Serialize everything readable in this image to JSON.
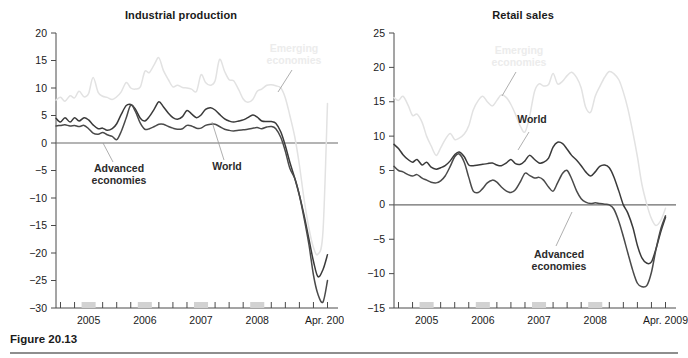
{
  "figure": {
    "caption": "Figure 20.13"
  },
  "panels": [
    {
      "id": "industrial-production",
      "title": "Industrial production",
      "ytick_labels": [
        "20",
        "15",
        "10",
        "5",
        "0",
        "−5",
        "−10",
        "−15",
        "−20",
        "−25",
        "−30"
      ],
      "xtick_labels": [
        "2005",
        "2006",
        "2007",
        "2008",
        "Apr. 2009"
      ],
      "annotations": [
        {
          "name": "emerging-economies",
          "text_lines": [
            "Emerging",
            "economies"
          ]
        },
        {
          "name": "advanced-economies",
          "text_lines": [
            "Advanced",
            "economies"
          ]
        },
        {
          "name": "world",
          "text_lines": [
            "World"
          ]
        }
      ]
    },
    {
      "id": "retail-sales",
      "title": "Retail sales",
      "ytick_labels": [
        "25",
        "20",
        "15",
        "10",
        "5",
        "0",
        "−5",
        "−10",
        "−15"
      ],
      "xtick_labels": [
        "2005",
        "2006",
        "2007",
        "2008",
        "Apr. 2009"
      ],
      "annotations": [
        {
          "name": "emerging-economies",
          "text_lines": [
            "Emerging",
            "economies"
          ]
        },
        {
          "name": "world",
          "text_lines": [
            "World"
          ]
        },
        {
          "name": "advanced-economies",
          "text_lines": [
            "Advanced",
            "economies"
          ]
        }
      ]
    }
  ],
  "colors": {
    "world_line": "#3a3a3a",
    "advanced_line": "#4a4a4a",
    "emerging_line": "#e2e2e2",
    "axis": "#4a4a4a",
    "zero_line": "#6b6b6b",
    "year_band": "#d2d2d2",
    "emerging_label": "#ececec",
    "text": "#1a1a1a"
  },
  "chart_data": [
    {
      "type": "line",
      "title": "Industrial production",
      "xlabel": "",
      "ylabel": "",
      "ylim": [
        -30,
        20
      ],
      "yticks": [
        20,
        15,
        10,
        5,
        0,
        -5,
        -10,
        -15,
        -20,
        -25,
        -30
      ],
      "xlim": [
        2004.42,
        2009.33
      ],
      "xticks": [
        2005,
        2006,
        2007,
        2008,
        2009.25
      ],
      "xtick_labels": [
        "2005",
        "2006",
        "2007",
        "2008",
        "Apr. 2009"
      ],
      "grid": false,
      "legend": "inline-annotations",
      "zero_line": true,
      "x": [
        2004.42,
        2004.5,
        2004.58,
        2004.67,
        2004.75,
        2004.83,
        2004.92,
        2005.0,
        2005.08,
        2005.17,
        2005.25,
        2005.33,
        2005.42,
        2005.5,
        2005.58,
        2005.67,
        2005.75,
        2005.83,
        2005.92,
        2006.0,
        2006.08,
        2006.17,
        2006.25,
        2006.33,
        2006.42,
        2006.5,
        2006.58,
        2006.67,
        2006.75,
        2006.83,
        2006.92,
        2007.0,
        2007.08,
        2007.17,
        2007.25,
        2007.33,
        2007.42,
        2007.5,
        2007.58,
        2007.67,
        2007.75,
        2007.83,
        2007.92,
        2008.0,
        2008.08,
        2008.17,
        2008.25,
        2008.33,
        2008.42,
        2008.5,
        2008.58,
        2008.67,
        2008.75,
        2008.83,
        2008.92,
        2009.0,
        2009.08,
        2009.17,
        2009.25
      ],
      "series": [
        {
          "name": "Emerging economies",
          "color": "#e2e2e2",
          "values": [
            7.8,
            8.3,
            7.6,
            8.6,
            8.2,
            9.4,
            8.4,
            9.0,
            11.9,
            9.2,
            8.5,
            8.3,
            7.9,
            8.4,
            9.3,
            11.0,
            10.0,
            9.8,
            10.2,
            13.0,
            12.8,
            14.3,
            15.5,
            13.2,
            11.5,
            10.2,
            10.5,
            10.1,
            10.0,
            9.8,
            9.4,
            12.4,
            11.0,
            10.5,
            11.3,
            15.2,
            13.0,
            11.5,
            11.3,
            9.7,
            8.0,
            7.4,
            7.9,
            9.4,
            9.8,
            10.5,
            10.6,
            10.4,
            10.0,
            8.2,
            5.0,
            1.0,
            -4.0,
            -10.0,
            -15.5,
            -19.0,
            -20.2,
            -16.0,
            7.2
          ]
        },
        {
          "name": "World",
          "color": "#3a3a3a",
          "values": [
            4.5,
            3.8,
            4.6,
            3.8,
            4.6,
            4.0,
            4.6,
            4.2,
            3.3,
            2.6,
            2.7,
            2.3,
            2.6,
            3.5,
            5.2,
            6.8,
            7.0,
            6.2,
            4.5,
            4.0,
            4.8,
            6.2,
            7.5,
            6.6,
            5.4,
            4.6,
            4.3,
            4.8,
            5.9,
            5.3,
            4.6,
            5.1,
            6.1,
            6.4,
            6.0,
            5.2,
            4.4,
            4.0,
            3.8,
            4.0,
            4.2,
            4.6,
            5.1,
            4.7,
            4.0,
            3.9,
            3.9,
            3.6,
            2.0,
            -0.5,
            -3.5,
            -6.5,
            -9.5,
            -13.0,
            -17.5,
            -21.5,
            -24.3,
            -23.0,
            -20.3
          ]
        },
        {
          "name": "Advanced economies",
          "color": "#4a4a4a",
          "values": [
            3.1,
            3.2,
            3.3,
            3.1,
            3.2,
            3.0,
            3.2,
            2.6,
            1.8,
            1.6,
            1.9,
            1.5,
            1.2,
            0.6,
            2.1,
            4.6,
            6.9,
            5.8,
            3.6,
            2.5,
            2.6,
            3.0,
            3.4,
            3.4,
            3.0,
            2.7,
            2.5,
            2.6,
            3.2,
            3.1,
            2.7,
            2.7,
            3.2,
            3.4,
            3.4,
            3.0,
            2.5,
            2.3,
            2.2,
            2.3,
            2.4,
            2.5,
            2.7,
            2.8,
            2.6,
            2.9,
            3.0,
            2.6,
            1.0,
            -1.5,
            -4.6,
            -6.5,
            -9.5,
            -13.5,
            -18.5,
            -24.0,
            -27.5,
            -28.9,
            -25.0
          ]
        }
      ]
    },
    {
      "type": "line",
      "title": "Retail sales",
      "xlabel": "",
      "ylabel": "",
      "ylim": [
        -15,
        25
      ],
      "yticks": [
        25,
        20,
        15,
        10,
        5,
        0,
        -5,
        -10,
        -15
      ],
      "xlim": [
        2004.42,
        2009.33
      ],
      "xticks": [
        2005,
        2006,
        2007,
        2008,
        2009.25
      ],
      "xtick_labels": [
        "2005",
        "2006",
        "2007",
        "2008",
        "Apr. 2009"
      ],
      "grid": false,
      "legend": "inline-annotations",
      "zero_line": true,
      "x": [
        2004.42,
        2004.5,
        2004.58,
        2004.67,
        2004.75,
        2004.83,
        2004.92,
        2005.0,
        2005.08,
        2005.17,
        2005.25,
        2005.33,
        2005.42,
        2005.5,
        2005.58,
        2005.67,
        2005.75,
        2005.83,
        2005.92,
        2006.0,
        2006.08,
        2006.17,
        2006.25,
        2006.33,
        2006.42,
        2006.5,
        2006.58,
        2006.67,
        2006.75,
        2006.83,
        2006.92,
        2007.0,
        2007.08,
        2007.17,
        2007.25,
        2007.33,
        2007.42,
        2007.5,
        2007.58,
        2007.67,
        2007.75,
        2007.83,
        2007.92,
        2008.0,
        2008.08,
        2008.17,
        2008.25,
        2008.33,
        2008.42,
        2008.5,
        2008.58,
        2008.67,
        2008.75,
        2008.83,
        2008.92,
        2009.0,
        2009.08,
        2009.17,
        2009.25
      ],
      "series": [
        {
          "name": "Emerging economies",
          "color": "#e2e2e2",
          "values": [
            15.6,
            15.2,
            15.8,
            14.5,
            13.0,
            13.2,
            12.0,
            10.0,
            8.6,
            7.2,
            8.3,
            9.5,
            10.4,
            9.5,
            9.7,
            10.3,
            11.5,
            13.8,
            15.2,
            15.8,
            15.0,
            14.4,
            15.2,
            16.0,
            15.6,
            14.6,
            13.2,
            11.4,
            10.6,
            12.8,
            16.5,
            17.6,
            17.3,
            17.5,
            19.1,
            17.6,
            18.0,
            18.8,
            19.3,
            18.5,
            17.0,
            14.2,
            13.5,
            15.8,
            17.2,
            18.6,
            19.4,
            19.1,
            18.2,
            16.4,
            14.0,
            10.5,
            7.0,
            3.0,
            0.0,
            -2.0,
            -3.0,
            -2.2,
            -0.5
          ]
        },
        {
          "name": "World",
          "color": "#3a3a3a",
          "values": [
            8.8,
            8.2,
            7.3,
            6.6,
            6.2,
            6.6,
            5.8,
            6.2,
            5.5,
            5.2,
            5.4,
            5.7,
            6.4,
            7.3,
            7.7,
            7.0,
            5.8,
            5.7,
            5.8,
            5.9,
            6.0,
            6.1,
            5.8,
            5.7,
            6.1,
            6.6,
            6.0,
            5.9,
            6.4,
            7.2,
            6.6,
            6.1,
            6.2,
            6.8,
            8.4,
            9.1,
            8.9,
            8.1,
            7.2,
            6.5,
            5.7,
            4.8,
            4.2,
            4.8,
            5.6,
            5.8,
            5.4,
            4.1,
            2.0,
            0.0,
            -1.2,
            -3.3,
            -5.9,
            -7.7,
            -8.5,
            -8.3,
            -6.4,
            -3.8,
            -1.8
          ]
        },
        {
          "name": "Advanced economies",
          "color": "#4a4a4a",
          "values": [
            5.6,
            5.0,
            4.8,
            4.4,
            4.2,
            4.4,
            3.9,
            3.6,
            3.3,
            3.2,
            3.5,
            4.2,
            5.6,
            7.0,
            7.4,
            6.2,
            4.0,
            2.0,
            1.8,
            2.4,
            3.2,
            3.6,
            3.3,
            2.6,
            2.0,
            1.8,
            2.2,
            3.4,
            4.6,
            4.3,
            3.9,
            4.0,
            3.6,
            2.6,
            2.0,
            3.2,
            4.6,
            5.0,
            3.8,
            2.0,
            0.9,
            0.4,
            0.2,
            0.3,
            0.2,
            0.1,
            0.0,
            -0.6,
            -2.4,
            -4.6,
            -7.0,
            -9.6,
            -11.4,
            -11.9,
            -11.7,
            -9.8,
            -6.5,
            -3.4,
            -1.6
          ]
        }
      ]
    }
  ]
}
